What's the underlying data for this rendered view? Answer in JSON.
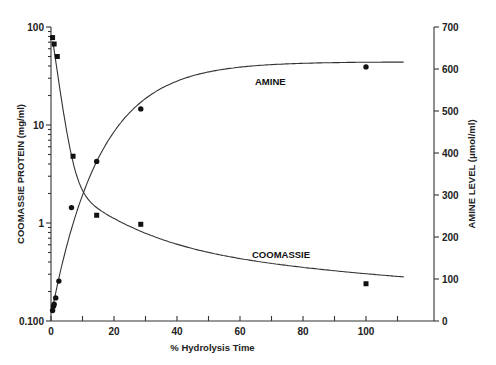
{
  "chart_data": {
    "type": "line",
    "title": "",
    "xlabel": "% Hydrolysis Time",
    "ylabel_left": "COOMASSIE PROTEIN (mg/ml)",
    "ylabel_right": "AMINE LEVEL (μmol/ml)",
    "x_ticks": [
      "0",
      "20",
      "40",
      "60",
      "80",
      "100"
    ],
    "xlim": [
      0,
      115
    ],
    "y_left_scale": "log",
    "y_left_ticks": [
      "0.100",
      "1",
      "10",
      "100"
    ],
    "y_left_lim": [
      0.1,
      100
    ],
    "y_right_scale": "linear",
    "y_right_ticks": [
      "0",
      "100",
      "200",
      "300",
      "400",
      "500",
      "600",
      "700"
    ],
    "y_right_lim": [
      0,
      700
    ],
    "grid": false,
    "legend": "inline curve labels",
    "series": [
      {
        "name": "COOMASSIE",
        "axis": "left",
        "marker": "square",
        "x": [
          0.5,
          1,
          2,
          7,
          14.5,
          28.5,
          100
        ],
        "values": [
          78,
          67,
          50,
          4.8,
          1.2,
          0.97,
          0.24
        ]
      },
      {
        "name": "AMINE",
        "axis": "right",
        "marker": "circle",
        "x": [
          0.5,
          0.8,
          1,
          1.5,
          2.5,
          6.5,
          14.5,
          28.5,
          100
        ],
        "values": [
          25,
          35,
          40,
          55,
          95,
          270,
          380,
          505,
          605
        ]
      }
    ],
    "annotations": [
      "AMINE",
      "COOMASSIE"
    ]
  }
}
